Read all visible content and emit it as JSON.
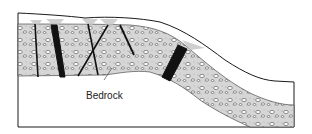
{
  "diagram": {
    "labels": {
      "bedrock": "Bedrock"
    },
    "colors": {
      "outline": "#1a1a1a",
      "layer_fill": "#d9d9d9",
      "pebble_fill": "#ffffff",
      "dike_fill": "#111111",
      "surface_stain": "#bdbdbd",
      "background": "#ffffff"
    }
  }
}
